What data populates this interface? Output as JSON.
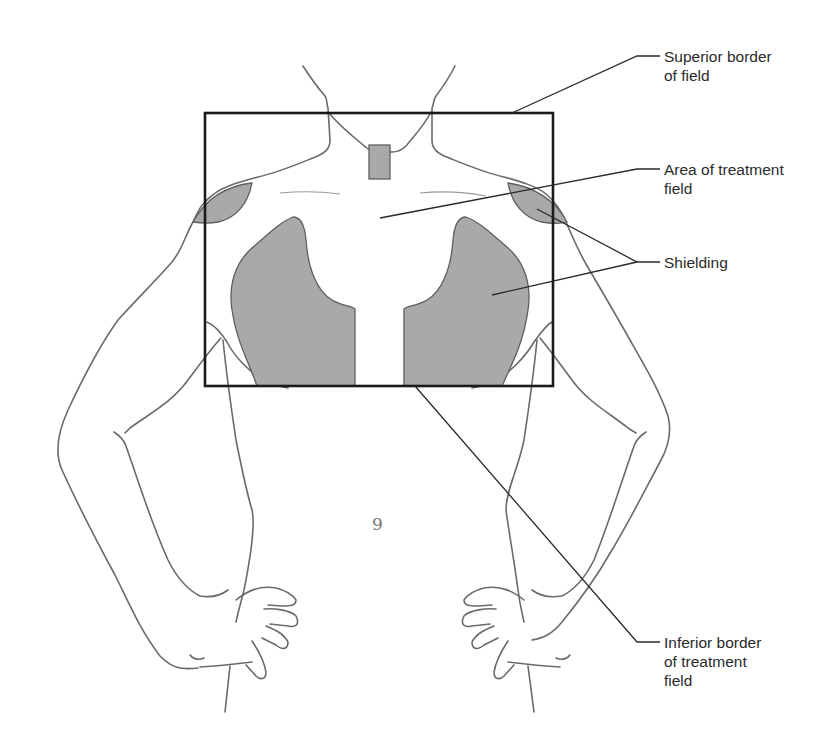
{
  "figure": {
    "colors": {
      "shielding": "#a9a9a9",
      "outline": "#6a6a6a",
      "field_border": "#1a1a1a",
      "leader": "#2a2a2a",
      "background": "#ffffff"
    }
  },
  "labels": {
    "superior_border": "Superior border\nof field",
    "area_treatment": "Area of treatment\nfield",
    "shielding": "Shielding",
    "inferior_border": "Inferior border\nof treatment\nfield"
  },
  "navel_glyph": "9"
}
